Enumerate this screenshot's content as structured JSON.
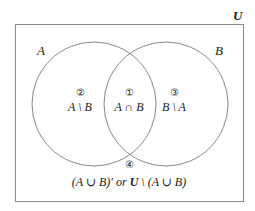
{
  "diagram": {
    "type": "venn",
    "universe": {
      "label": "U"
    },
    "sets": [
      {
        "label": "A"
      },
      {
        "label": "B"
      }
    ],
    "regions": [
      {
        "number": "①",
        "expression": "A ∩ B"
      },
      {
        "number": "②",
        "expression": "A \\ B"
      },
      {
        "number": "③",
        "expression": "B \\ A"
      },
      {
        "number": "④",
        "expression_part1": "(A ∪ B)′ or ",
        "expression_bold": "U",
        "expression_part2": " \\ (A ∪ B)"
      }
    ],
    "colors": {
      "stroke": "#7a7a7a",
      "text": "#1a1a1a",
      "background": "#ffffff"
    }
  }
}
